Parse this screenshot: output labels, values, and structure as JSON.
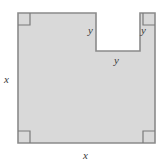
{
  "figure": {
    "kind": "geometry-diagram",
    "colors": {
      "fill": "#d9d9d9",
      "stroke": "#8a8a8a",
      "background": "#ffffff",
      "label": "#3a3a3a",
      "corner_marker": "#7a7a7a"
    },
    "outer_square": {
      "left": 18,
      "top": 13,
      "right": 155,
      "bottom": 143,
      "side_label": "x"
    },
    "notch": {
      "left": 96,
      "right": 140,
      "top": 13,
      "bottom": 51,
      "side_label": "y"
    },
    "labels": {
      "x_left": "x",
      "x_bottom": "x",
      "y_notch_left": "y",
      "y_notch_right": "y",
      "y_notch_bottom": "y"
    },
    "right_angle_markers": [
      {
        "name": "top-left",
        "x": 18,
        "y": 13
      },
      {
        "name": "top-right",
        "x": 155,
        "y": 13
      },
      {
        "name": "bottom-left",
        "x": 18,
        "y": 143
      },
      {
        "name": "bottom-right",
        "x": 155,
        "y": 143
      }
    ],
    "path": "M 18 13 L 96 13 L 96 51 L 140 51 L 140 13 L 155 13 L 155 143 L 18 143 Z"
  }
}
